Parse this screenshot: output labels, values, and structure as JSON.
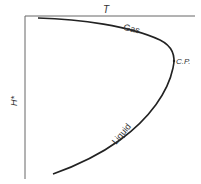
{
  "diagram": {
    "x_axis_label": "T",
    "y_axis_label": "H*",
    "curve_labels": {
      "gas": "Gas",
      "critical_point": "C.P.",
      "liquid": "Liquid"
    },
    "colors": {
      "axis": "#666666",
      "curve": "#222222",
      "text": "#333333"
    }
  }
}
